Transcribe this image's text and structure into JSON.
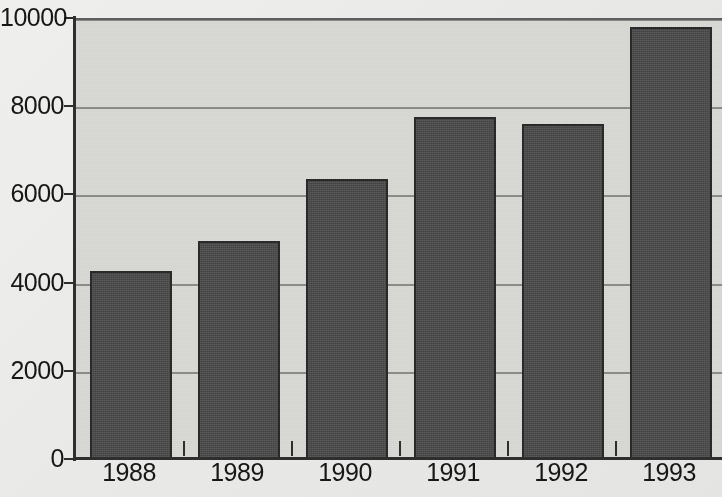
{
  "chart_data": {
    "type": "bar",
    "title": "",
    "subtitle": "",
    "xlabel": "",
    "ylabel": "",
    "categories": [
      "1988",
      "1989",
      "1990",
      "1991",
      "1992",
      "1993"
    ],
    "values": [
      4300,
      5000,
      6400,
      7800,
      7650,
      9850
    ],
    "series": [
      {
        "name": "",
        "values": [
          4300,
          5000,
          6400,
          7800,
          7650,
          9850
        ]
      }
    ],
    "ylim": [
      0,
      10000
    ],
    "yticks": [
      0,
      2000,
      4000,
      6000,
      8000,
      10000
    ],
    "ytick_labels": [
      "0",
      "2000",
      "4000",
      "6000",
      "8000",
      "10000"
    ],
    "grid": true,
    "grid_axis": "y",
    "legend": false,
    "legend_position": "none",
    "colors": {
      "bar_fill": "#4a4a4a",
      "bar_edge": "#2a2a2a",
      "plot_background": "#d9d9d6",
      "figure_background": "#ebebe9",
      "gridline": "#8b8b88",
      "axis": "#2e2e2e",
      "tick_label": "#171717"
    }
  }
}
